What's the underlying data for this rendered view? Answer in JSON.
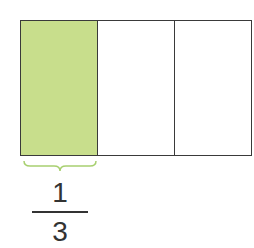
{
  "diagram": {
    "type": "fraction-bar",
    "total_parts": 3,
    "shaded_parts": 1,
    "parts": [
      {
        "index": 0,
        "shaded": true,
        "color": "#c8de8c"
      },
      {
        "index": 1,
        "shaded": false,
        "color": "#ffffff"
      },
      {
        "index": 2,
        "shaded": false,
        "color": "#ffffff"
      }
    ],
    "border_color": "#3a3a3a",
    "brace_color": "#a8d070",
    "label": {
      "numerator": "1",
      "denominator": "3"
    }
  }
}
